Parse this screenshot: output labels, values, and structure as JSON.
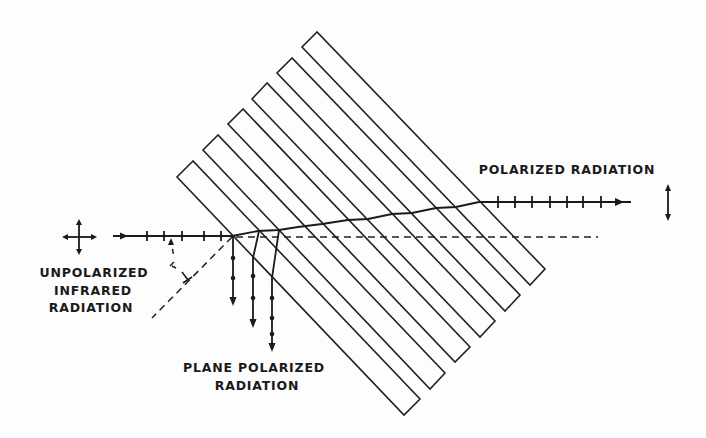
{
  "diagram": {
    "labels": {
      "incident": [
        "UNPOLARIZED",
        "INFRARED",
        "RADIATION"
      ],
      "transmitted": "POLARIZED RADIATION",
      "reflected": [
        "PLANE POLARIZED",
        "RADIATION"
      ],
      "angle": "i"
    },
    "colors": {
      "line": "#1a1a1a",
      "background": "#fdfdfd"
    },
    "plates": [
      {
        "top": [
          317,
          32
        ],
        "left": [
          302,
          47
        ],
        "bottom": [
          530,
          285
        ],
        "right": [
          545,
          269
        ]
      },
      {
        "top": [
          292,
          58
        ],
        "left": [
          277,
          73
        ],
        "bottom": [
          505,
          311
        ],
        "right": [
          520,
          295
        ]
      },
      {
        "top": [
          267,
          83
        ],
        "left": [
          252,
          99
        ],
        "bottom": [
          480,
          337
        ],
        "right": [
          495,
          321
        ]
      },
      {
        "top": [
          243,
          109
        ],
        "left": [
          228,
          124
        ],
        "bottom": [
          455,
          362
        ],
        "right": [
          470,
          347
        ]
      },
      {
        "top": [
          218,
          135
        ],
        "left": [
          203,
          150
        ],
        "bottom": [
          430,
          389
        ],
        "right": [
          445,
          373
        ]
      },
      {
        "top": [
          193,
          161
        ],
        "left": [
          177,
          177
        ],
        "bottom": [
          404,
          415
        ],
        "right": [
          420,
          399
        ]
      }
    ]
  }
}
